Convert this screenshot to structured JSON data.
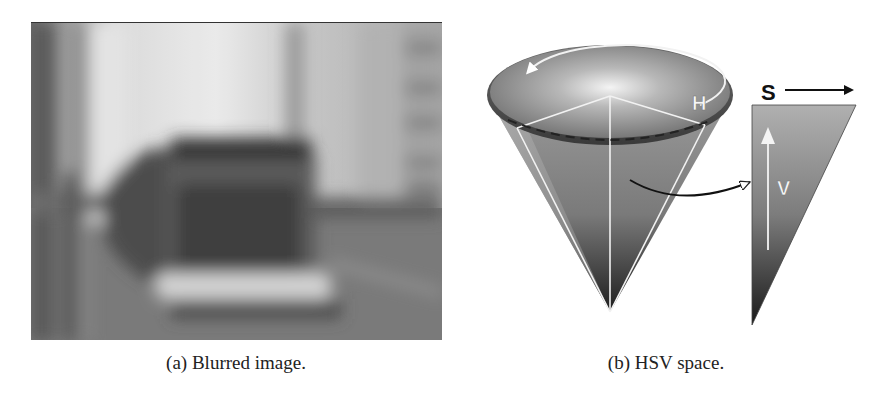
{
  "figure": {
    "subfigures": [
      {
        "id": "a",
        "label": "(a)",
        "caption": "(a) Blurred image.",
        "content": "grayscale motion-blurred street photo with a bus"
      },
      {
        "id": "b",
        "label": "(b)",
        "caption": "(b) HSV space.",
        "content": "HSV cone diagram with value/saturation cross-section triangle",
        "axis_labels": {
          "hue": "H",
          "saturation": "S",
          "value": "V"
        }
      }
    ]
  }
}
